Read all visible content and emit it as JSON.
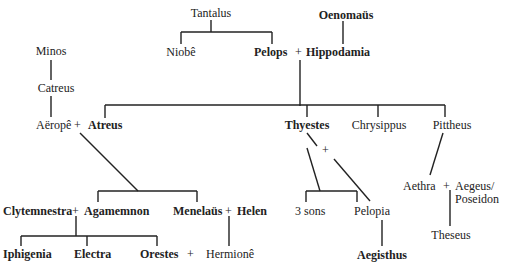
{
  "nodes": {
    "tantalus": "Tantalus",
    "oenomaus": "Oenomaüs",
    "niobe": "Niobê",
    "pelops": "Pelops",
    "hippodamia": "Hippodamia",
    "minos": "Minos",
    "catreus": "Catreus",
    "aerope": "Aëropê",
    "atreus": "Atreus",
    "thyestes": "Thyestes",
    "chrysippus": "Chrysippus",
    "pittheus": "Pittheus",
    "clytemnestra": "Clytemnestra",
    "agamemnon": "Agamemnon",
    "menelaus": "Menelaüs",
    "helen": "Helen",
    "three_sons": "3 sons",
    "pelopia": "Pelopia",
    "aethra": "Aethra",
    "aegeus": "Aegeus/",
    "poseidon": "Poseidon",
    "theseus": "Theseus",
    "iphigenia": "Iphigenia",
    "electra": "Electra",
    "orestes": "Orestes",
    "hermione": "Hermionê",
    "aegisthus": "Aegisthus"
  },
  "symbols": {
    "union": "+"
  }
}
